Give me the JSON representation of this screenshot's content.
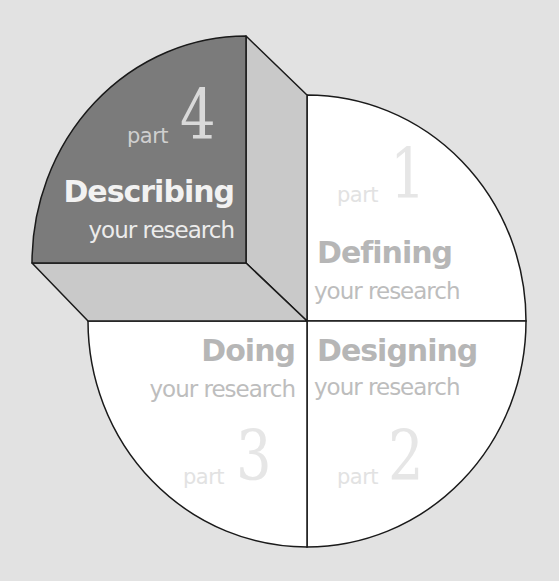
{
  "diagram": {
    "colors": {
      "background": "#e2e2e2",
      "circle_fill": "#ffffff",
      "raised_top_face": "#7b7b7b",
      "raised_side_face": "#c9c9c9",
      "outline": "#1a1a1a"
    },
    "quadrants": [
      {
        "id": "part1",
        "position": "top-right",
        "part_label": "part",
        "number": "1",
        "title": "Defining",
        "subtitle": "your research",
        "highlighted": false
      },
      {
        "id": "part2",
        "position": "bottom-right",
        "part_label": "part",
        "number": "2",
        "title": "Designing",
        "subtitle": "your research",
        "highlighted": false
      },
      {
        "id": "part3",
        "position": "bottom-left",
        "part_label": "part",
        "number": "3",
        "title": "Doing",
        "subtitle": "your research",
        "highlighted": false
      },
      {
        "id": "part4",
        "position": "top-left",
        "part_label": "part",
        "number": "4",
        "title": "Describing",
        "subtitle": "your research",
        "highlighted": true
      }
    ]
  }
}
